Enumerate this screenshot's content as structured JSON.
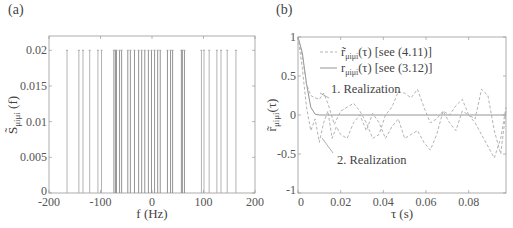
{
  "panels": {
    "a": {
      "label": "(a)"
    },
    "b": {
      "label": "(b)"
    }
  },
  "chart_data": [
    {
      "type": "bar",
      "subtype": "stem",
      "panel": "(a)",
      "title": "",
      "xlabel": "f (Hz)",
      "ylabel": "S̃_{μiμi}(f)",
      "xlim": [
        -200,
        200
      ],
      "ylim": [
        0,
        0.022
      ],
      "xticks": [
        "-200",
        "-100",
        "0",
        "100",
        "200"
      ],
      "yticks": [
        "0",
        "0.005",
        "0.01",
        "0.015",
        "0.02"
      ],
      "grid": false,
      "x": [
        -165,
        -142,
        -134,
        -121,
        -105,
        -98,
        -74,
        -71,
        -69,
        -63,
        -59,
        -47,
        -42,
        -34,
        -26,
        -20,
        -14,
        -7,
        -1,
        5,
        11,
        16,
        30,
        36,
        40,
        57,
        59,
        63,
        96,
        101,
        111,
        126,
        134,
        146,
        163
      ],
      "values": [
        0.02,
        0.02,
        0.02,
        0.02,
        0.02,
        0.02,
        0.02,
        0.02,
        0.02,
        0.02,
        0.02,
        0.02,
        0.02,
        0.02,
        0.02,
        0.02,
        0.02,
        0.02,
        0.02,
        0.02,
        0.02,
        0.02,
        0.02,
        0.02,
        0.02,
        0.02,
        0.02,
        0.02,
        0.02,
        0.02,
        0.02,
        0.02,
        0.02,
        0.02,
        0.02
      ]
    },
    {
      "type": "line",
      "panel": "(b)",
      "title": "",
      "xlabel": "τ (s)",
      "ylabel": "r̃_{μiμi}(τ)",
      "xlim": [
        0,
        0.0975
      ],
      "ylim": [
        -1,
        1
      ],
      "xticks": [
        "0",
        "0.02",
        "0.04",
        "0.06",
        "0.08"
      ],
      "yticks": [
        "-1",
        "-0.5",
        "0",
        "0.5",
        "1"
      ],
      "grid": false,
      "legend": {
        "position": "upper right inside",
        "entries": [
          {
            "label": "r̃_{μiμi}(τ) [see (4.11)]",
            "style": "dashed"
          },
          {
            "label": "r_{μiμi}(τ) [see (3.12)]",
            "style": "solid"
          }
        ]
      },
      "annotations": [
        "1. Realization",
        "2. Realization"
      ],
      "series": [
        {
          "name": "r_{μiμi}(τ) [see (3.12)]",
          "style": "solid",
          "x": [
            0,
            0.002,
            0.004,
            0.006,
            0.008,
            0.01,
            0.02,
            0.04,
            0.06,
            0.08,
            0.0975
          ],
          "values": [
            1,
            0.8,
            0.4,
            0.1,
            0.01,
            0,
            0,
            0,
            0,
            0,
            0
          ]
        },
        {
          "name": "1. Realization",
          "style": "dashed",
          "x": [
            0,
            0.002,
            0.004,
            0.006,
            0.008,
            0.01,
            0.012,
            0.014,
            0.017,
            0.02,
            0.023,
            0.026,
            0.029,
            0.032,
            0.035,
            0.038,
            0.041,
            0.044,
            0.047,
            0.05,
            0.053,
            0.056,
            0.059,
            0.062,
            0.065,
            0.068,
            0.071,
            0.074,
            0.077,
            0.08,
            0.083,
            0.086,
            0.089,
            0.092,
            0.095,
            0.0975
          ],
          "values": [
            1,
            0.75,
            0.4,
            0.25,
            0.22,
            0.2,
            0.28,
            0.15,
            -0.12,
            0.05,
            0.1,
            0.15,
            0.05,
            -0.1,
            -0.3,
            -0.25,
            0.0,
            0.1,
            0.3,
            0.28,
            0.22,
            0.33,
            0.1,
            -0.1,
            -0.05,
            0.05,
            0.0,
            0.12,
            0.2,
            0.0,
            -0.05,
            0.33,
            0.25,
            -0.2,
            -0.5,
            0.05
          ]
        },
        {
          "name": "2. Realization",
          "style": "dashed",
          "x": [
            0,
            0.002,
            0.004,
            0.006,
            0.008,
            0.01,
            0.012,
            0.014,
            0.016,
            0.018,
            0.02,
            0.023,
            0.026,
            0.029,
            0.032,
            0.035,
            0.038,
            0.041,
            0.044,
            0.047,
            0.05,
            0.053,
            0.056,
            0.059,
            0.062,
            0.065,
            0.068,
            0.071,
            0.074,
            0.077,
            0.08,
            0.083,
            0.086,
            0.089,
            0.092,
            0.095,
            0.0975
          ],
          "values": [
            1,
            0.6,
            0.1,
            -0.2,
            -0.05,
            -0.35,
            -0.1,
            0.05,
            -0.3,
            -0.15,
            -0.25,
            -0.3,
            -0.1,
            0.0,
            -0.2,
            0.02,
            -0.1,
            -0.3,
            -0.15,
            -0.05,
            -0.3,
            -0.25,
            -0.2,
            -0.35,
            -0.45,
            -0.25,
            0.05,
            -0.1,
            -0.2,
            0.05,
            0.0,
            -0.1,
            -0.25,
            -0.4,
            -0.55,
            -0.3,
            0.1
          ]
        }
      ]
    }
  ]
}
